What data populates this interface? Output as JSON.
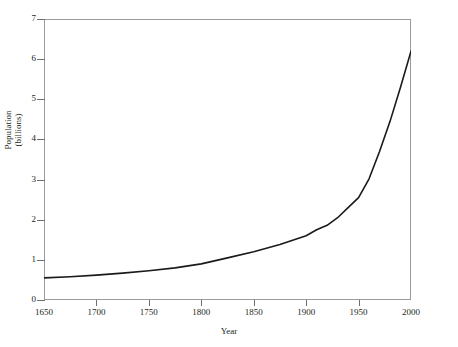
{
  "chart_data": {
    "type": "line",
    "title": "",
    "xlabel": "Year",
    "ylabel_line1": "Population",
    "ylabel_line2": "(billions)",
    "ylabel": "Population (billions)",
    "xlim": [
      1650,
      2000
    ],
    "ylim": [
      0,
      7
    ],
    "grid": false,
    "legend": "none",
    "xticks": [
      1650,
      1700,
      1750,
      1800,
      1850,
      1900,
      1950,
      2000
    ],
    "xtick_labels": [
      "1650",
      "1700",
      "1750",
      "1800",
      "1850",
      "1900",
      "1950",
      "2000"
    ],
    "yticks": [
      0,
      1,
      2,
      3,
      4,
      5,
      6,
      7
    ],
    "ytick_labels": [
      "0",
      "1",
      "2",
      "3",
      "4",
      "5",
      "6",
      "7"
    ],
    "series": [
      {
        "name": "World population",
        "color": "#1a1a1a",
        "x": [
          1650,
          1675,
          1700,
          1725,
          1750,
          1775,
          1800,
          1825,
          1850,
          1875,
          1900,
          1910,
          1920,
          1930,
          1940,
          1950,
          1960,
          1970,
          1980,
          1990,
          2000
        ],
        "values": [
          0.55,
          0.58,
          0.62,
          0.67,
          0.73,
          0.8,
          0.9,
          1.05,
          1.2,
          1.38,
          1.6,
          1.75,
          1.86,
          2.05,
          2.3,
          2.55,
          3.02,
          3.7,
          4.45,
          5.3,
          6.2
        ]
      }
    ],
    "annotations": []
  },
  "figure": {
    "background_color": "#ffffff",
    "frame_color": "#9b9b9b",
    "curve_color": "#1a1a1a",
    "tick_color": "#6f6f6f"
  }
}
